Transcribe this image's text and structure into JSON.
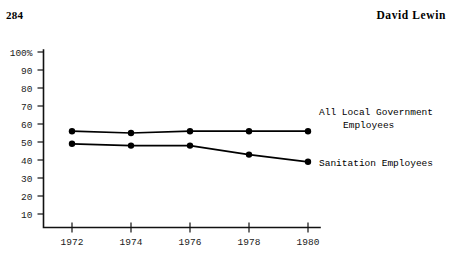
{
  "header": {
    "page_number": "284",
    "running_head": "David Lewin"
  },
  "chart_data": {
    "type": "line",
    "title": "",
    "xlabel": "",
    "ylabel": "",
    "x": [
      1972,
      1974,
      1976,
      1978,
      1980
    ],
    "categories": [
      "1972",
      "1974",
      "1976",
      "1978",
      "1980"
    ],
    "xtick_labels": [
      "1972",
      "1974",
      "1976",
      "1978",
      "1980"
    ],
    "ytick_labels": [
      "100%",
      "90",
      "80",
      "70",
      "60",
      "50",
      "40",
      "30",
      "20",
      "10"
    ],
    "ytick_values": [
      100,
      90,
      80,
      70,
      60,
      50,
      40,
      30,
      20,
      10
    ],
    "ylim": [
      0,
      100
    ],
    "xlim": [
      1971,
      1981
    ],
    "grid": false,
    "legend_position": "inline-right",
    "series": [
      {
        "name": "All Local Government Employees",
        "label_line1": "All Local Government",
        "label_line2": "Employees",
        "values": [
          56,
          55,
          56,
          56,
          56
        ],
        "marker": "filled-circle",
        "color": "#000000"
      },
      {
        "name": "Sanitation Employees",
        "label_line1": "Sanitation Employees",
        "label_line2": "",
        "values": [
          49,
          48,
          48,
          43,
          39
        ],
        "marker": "filled-circle",
        "color": "#000000"
      }
    ]
  }
}
